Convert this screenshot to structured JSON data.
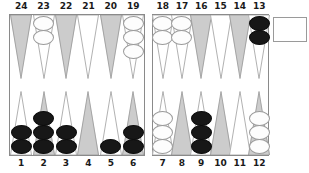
{
  "game": {
    "name": "backgammon-board",
    "colors": {
      "point_dark": "#cccccc",
      "point_light": "#ffffff",
      "checker_white": "#fdfdfd",
      "checker_black": "#171717",
      "board_border": "#8a8a8a",
      "label_text": "#1a1a1a",
      "background": "#ffffff"
    },
    "top_labels": [
      "24",
      "23",
      "22",
      "21",
      "20",
      "19",
      "18",
      "17",
      "16",
      "15",
      "14",
      "13"
    ],
    "bottom_labels": [
      "1",
      "2",
      "3",
      "4",
      "5",
      "6",
      "7",
      "8",
      "9",
      "10",
      "11",
      "12"
    ],
    "tray": {
      "label": "",
      "contents": "empty"
    },
    "points": [
      {
        "number": "24",
        "row": "top",
        "quadrant": "left",
        "shade": "dark",
        "checkers": 0,
        "color": "none"
      },
      {
        "number": "23",
        "row": "top",
        "quadrant": "left",
        "shade": "light",
        "checkers": 2,
        "color": "white"
      },
      {
        "number": "22",
        "row": "top",
        "quadrant": "left",
        "shade": "dark",
        "checkers": 0,
        "color": "none"
      },
      {
        "number": "21",
        "row": "top",
        "quadrant": "left",
        "shade": "light",
        "checkers": 0,
        "color": "none"
      },
      {
        "number": "20",
        "row": "top",
        "quadrant": "left",
        "shade": "dark",
        "checkers": 0,
        "color": "none"
      },
      {
        "number": "19",
        "row": "top",
        "quadrant": "left",
        "shade": "light",
        "checkers": 3,
        "color": "white"
      },
      {
        "number": "18",
        "row": "top",
        "quadrant": "right",
        "shade": "light",
        "checkers": 2,
        "color": "white"
      },
      {
        "number": "17",
        "row": "top",
        "quadrant": "right",
        "shade": "light",
        "checkers": 2,
        "color": "white"
      },
      {
        "number": "16",
        "row": "top",
        "quadrant": "right",
        "shade": "dark",
        "checkers": 0,
        "color": "none"
      },
      {
        "number": "15",
        "row": "top",
        "quadrant": "right",
        "shade": "light",
        "checkers": 0,
        "color": "none"
      },
      {
        "number": "14",
        "row": "top",
        "quadrant": "right",
        "shade": "dark",
        "checkers": 0,
        "color": "none"
      },
      {
        "number": "13",
        "row": "top",
        "quadrant": "right",
        "shade": "light",
        "checkers": 2,
        "color": "black"
      },
      {
        "number": "1",
        "row": "bottom",
        "quadrant": "left",
        "shade": "light",
        "checkers": 2,
        "color": "black"
      },
      {
        "number": "2",
        "row": "bottom",
        "quadrant": "left",
        "shade": "dark",
        "checkers": 3,
        "color": "black"
      },
      {
        "number": "3",
        "row": "bottom",
        "quadrant": "left",
        "shade": "light",
        "checkers": 2,
        "color": "black"
      },
      {
        "number": "4",
        "row": "bottom",
        "quadrant": "left",
        "shade": "dark",
        "checkers": 0,
        "color": "none"
      },
      {
        "number": "5",
        "row": "bottom",
        "quadrant": "left",
        "shade": "light",
        "checkers": 1,
        "color": "black"
      },
      {
        "number": "6",
        "row": "bottom",
        "quadrant": "left",
        "shade": "dark",
        "checkers": 2,
        "color": "black"
      },
      {
        "number": "7",
        "row": "bottom",
        "quadrant": "right",
        "shade": "light",
        "checkers": 3,
        "color": "white"
      },
      {
        "number": "8",
        "row": "bottom",
        "quadrant": "right",
        "shade": "dark",
        "checkers": 0,
        "color": "none"
      },
      {
        "number": "9",
        "row": "bottom",
        "quadrant": "right",
        "shade": "light",
        "checkers": 3,
        "color": "black"
      },
      {
        "number": "10",
        "row": "bottom",
        "quadrant": "right",
        "shade": "dark",
        "checkers": 0,
        "color": "none"
      },
      {
        "number": "11",
        "row": "bottom",
        "quadrant": "right",
        "shade": "light",
        "checkers": 0,
        "color": "none"
      },
      {
        "number": "12",
        "row": "bottom",
        "quadrant": "right",
        "shade": "dark",
        "checkers": 3,
        "color": "white"
      }
    ]
  }
}
